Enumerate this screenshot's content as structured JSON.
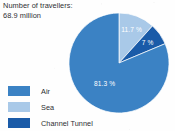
{
  "figure": {
    "background_color": "#fefefe",
    "title_lines": [
      "Number of travellers:",
      "68.9 million"
    ]
  },
  "chart_data": {
    "type": "pie",
    "title": "Number of travellers: 68.9 million",
    "subtitle": "",
    "xlabel": "",
    "ylabel": "",
    "unit": "%",
    "total_label": "68.9 million",
    "total_value": 68.9,
    "legend_position": "bottom-left",
    "grid": false,
    "start_angle_deg": 0,
    "direction": "clockwise",
    "categories": [
      "Air",
      "Sea",
      "Channel Tunnel"
    ],
    "values": [
      81.3,
      11.7,
      7
    ],
    "data_labels": [
      "81.3 %",
      "11.7 %",
      "7 %"
    ],
    "colors": [
      "#3b82c4",
      "#a9c9e8",
      "#1a5ba8"
    ],
    "slices": [
      {
        "label": "Sea",
        "value": 11.7,
        "data_label": "11.7 %",
        "color": "#a9c9e8",
        "start_angle_deg": 0,
        "end_angle_deg": 42.1
      },
      {
        "label": "Channel Tunnel",
        "value": 7,
        "data_label": "7 %",
        "color": "#1a5ba8",
        "start_angle_deg": 42.1,
        "end_angle_deg": 67.3
      },
      {
        "label": "Air",
        "value": 81.3,
        "data_label": "81.3 %",
        "color": "#3b82c4",
        "start_angle_deg": 67.3,
        "end_angle_deg": 360
      }
    ]
  },
  "legend": {
    "items": [
      {
        "label": "Air",
        "color": "#3b82c4"
      },
      {
        "label": "Sea",
        "color": "#a9c9e8"
      },
      {
        "label": "Channel Tunnel",
        "color": "#1a5ba8"
      }
    ]
  }
}
